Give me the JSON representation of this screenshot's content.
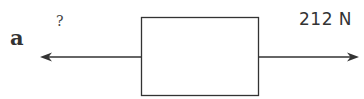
{
  "question": {
    "label": "a"
  },
  "diagram": {
    "type": "free-body",
    "body": "box",
    "forces": [
      {
        "direction": "left",
        "label": "?"
      },
      {
        "direction": "right",
        "label": "212 N"
      }
    ],
    "colors": {
      "line": "#333333",
      "text": "#333333"
    }
  }
}
